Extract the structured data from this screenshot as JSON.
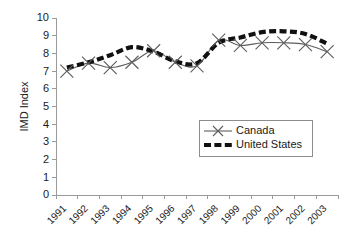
{
  "chart_data": {
    "type": "line",
    "title": "",
    "xlabel": "",
    "ylabel": "IMD Index",
    "ylim": [
      0,
      10
    ],
    "ytick_step": 1,
    "grid": false,
    "legend_position": "center-right",
    "categories": [
      "1991",
      "1992",
      "1993",
      "1994",
      "1995",
      "1996",
      "1997",
      "1998",
      "1999",
      "2000",
      "2001",
      "2002",
      "2003"
    ],
    "yticks": [
      "0",
      "1",
      "2",
      "3",
      "4",
      "5",
      "6",
      "7",
      "8",
      "9",
      "10"
    ],
    "series": [
      {
        "name": "Canada",
        "marker": "x",
        "line_style": "solid",
        "color": "#5d5d5d",
        "values": [
          7.0,
          7.45,
          7.2,
          7.5,
          8.15,
          7.5,
          7.3,
          8.75,
          8.45,
          8.6,
          8.6,
          8.5,
          8.1
        ]
      },
      {
        "name": "United States",
        "marker": "none",
        "line_style": "dashed",
        "color": "#111111",
        "values": [
          7.2,
          7.5,
          7.9,
          8.35,
          8.1,
          7.55,
          7.45,
          8.6,
          8.9,
          9.2,
          9.25,
          9.1,
          8.55
        ]
      }
    ]
  },
  "legend": {
    "entries": [
      {
        "label": "Canada"
      },
      {
        "label": "United States"
      }
    ]
  },
  "axes": {
    "y_title": "IMD Index"
  }
}
